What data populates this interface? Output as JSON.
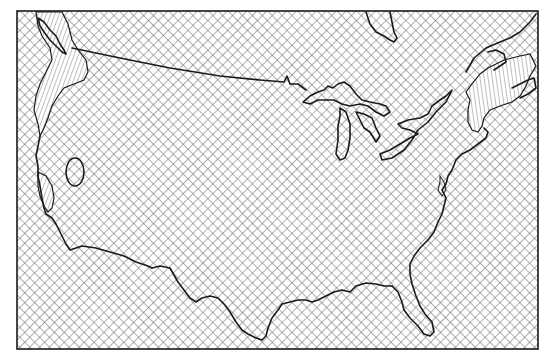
{
  "map": {
    "title": "Contiguous United States zone map",
    "region": "Contiguous United States",
    "frame": {
      "x": 17,
      "y": 11,
      "width": 521,
      "height": 338
    },
    "colors": {
      "background": "#ffffff",
      "outline": "#1a1a1a",
      "crosshatch": "#6e6e6e"
    },
    "zones": [
      {
        "id": "crosshatch-zone",
        "pattern": "diagonal-crosshatch",
        "covers": "most of map including land and water"
      },
      {
        "id": "pacific-northwest-zone",
        "pattern": "fine-diagonal-lines",
        "location": "Washington / Oregon / British Columbia coast"
      },
      {
        "id": "california-coast-zone",
        "pattern": "fine-diagonal-lines",
        "location": "Northern California coast"
      },
      {
        "id": "new-england-zone",
        "pattern": "fine-vertical-lines",
        "location": "New England / Maritime Canada"
      }
    ],
    "features": [
      {
        "id": "nevada-oval",
        "label": "isolated oval region",
        "location": "western Nevada"
      },
      {
        "id": "great-lakes",
        "label": "Great Lakes outlines"
      },
      {
        "id": "hudson-bay-james-bay",
        "label": "James Bay inlet outline"
      },
      {
        "id": "canada-border",
        "label": "US-Canada border"
      },
      {
        "id": "gulf-coast",
        "label": "Gulf of Mexico coastline"
      },
      {
        "id": "atlantic-coast",
        "label": "Atlantic coastline"
      },
      {
        "id": "pacific-coast",
        "label": "Pacific coastline"
      }
    ]
  }
}
